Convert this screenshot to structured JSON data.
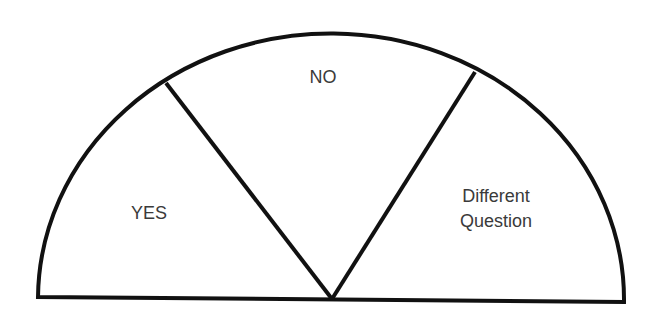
{
  "diagram": {
    "type": "semicircle-spinner",
    "segments": [
      {
        "id": "yes",
        "label": "YES"
      },
      {
        "id": "no",
        "label": "NO"
      },
      {
        "id": "different",
        "label_line1": "Different",
        "label_line2": "Question"
      }
    ],
    "colors": {
      "stroke": "#111111",
      "fill": "#ffffff",
      "text": "#3a3a3a"
    }
  }
}
